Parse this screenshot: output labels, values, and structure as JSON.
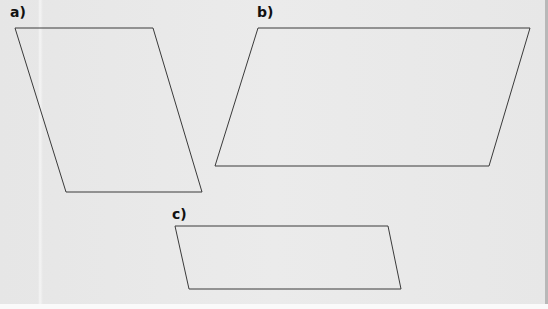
{
  "figure": {
    "background_color": "#e9e9e9",
    "stroke_color": "#3a3a3a",
    "shapes": [
      {
        "id": "a",
        "label": "a)",
        "type": "parallelogram",
        "label_pos": [
          10,
          5
        ],
        "points": "15,28 153,28 202,192 66,192"
      },
      {
        "id": "b",
        "label": "b)",
        "type": "parallelogram",
        "label_pos": [
          257,
          5
        ],
        "points": "258,28 530,28 489,166 215,166"
      },
      {
        "id": "c",
        "label": "c)",
        "type": "parallelogram",
        "label_pos": [
          172,
          207
        ],
        "points": "175,226 388,226 401,289 189,289"
      }
    ]
  }
}
